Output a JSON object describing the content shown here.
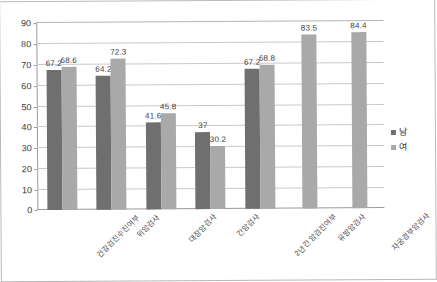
{
  "chart_data": {
    "type": "bar",
    "title": "",
    "subtitle": "",
    "xlabel": "",
    "ylabel": "",
    "ylim": [
      0,
      90
    ],
    "ytick_step": 10,
    "yticks": [
      0,
      10,
      20,
      30,
      40,
      50,
      60,
      70,
      80,
      90
    ],
    "grid": true,
    "legend_position": "right",
    "categories": [
      "건강검진수진여부",
      "위암검사",
      "대장암검사",
      "간암검사",
      "2년간 암검진여부",
      "유방암검사",
      "자궁경부암검사"
    ],
    "series": [
      {
        "name": "남",
        "color": "#6f6f6f",
        "values": [
          67.2,
          64.2,
          41.6,
          37,
          67.2,
          null,
          null
        ],
        "labels": [
          "67.2",
          "64.2",
          "41.6",
          "37",
          "67.2",
          "",
          ""
        ]
      },
      {
        "name": "여",
        "color": "#a9a9a9",
        "values": [
          68.6,
          72.3,
          45.8,
          30.2,
          68.8,
          83.5,
          84.4
        ],
        "labels": [
          "68.6",
          "72.3",
          "45.8",
          "30.2",
          "68.8",
          "83.5",
          "84.4"
        ]
      }
    ]
  },
  "legend": {
    "items": [
      {
        "label": "남",
        "color": "#6f6f6f"
      },
      {
        "label": "여",
        "color": "#a9a9a9"
      }
    ]
  },
  "axis": {
    "y_tick_labels": [
      "90",
      "80",
      "70",
      "60",
      "50",
      "40",
      "30",
      "20",
      "10",
      "0"
    ]
  }
}
